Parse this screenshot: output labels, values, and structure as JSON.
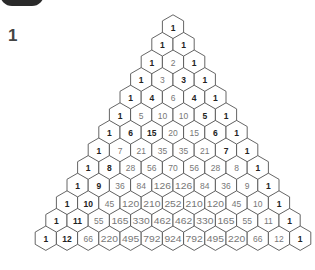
{
  "label": "1",
  "triangle": {
    "rows": [
      [
        1
      ],
      [
        1,
        1
      ],
      [
        1,
        2,
        1
      ],
      [
        1,
        3,
        3,
        1
      ],
      [
        1,
        4,
        6,
        4,
        1
      ],
      [
        1,
        5,
        10,
        10,
        5,
        1
      ],
      [
        1,
        6,
        15,
        20,
        15,
        6,
        1
      ],
      [
        1,
        7,
        21,
        35,
        35,
        21,
        7,
        1
      ],
      [
        1,
        8,
        28,
        56,
        70,
        56,
        28,
        8,
        1
      ],
      [
        1,
        9,
        36,
        84,
        126,
        126,
        84,
        36,
        9,
        1
      ],
      [
        1,
        10,
        45,
        120,
        210,
        252,
        210,
        120,
        45,
        10,
        1
      ],
      [
        1,
        11,
        55,
        165,
        330,
        462,
        462,
        330,
        165,
        55,
        11,
        1
      ],
      [
        1,
        12,
        66,
        220,
        495,
        792,
        924,
        792,
        495,
        220,
        66,
        12,
        1
      ]
    ],
    "bold": [
      [
        0,
        0
      ],
      [
        1,
        0
      ],
      [
        1,
        1
      ],
      [
        2,
        0
      ],
      [
        2,
        2
      ],
      [
        3,
        0
      ],
      [
        3,
        2
      ],
      [
        3,
        3
      ],
      [
        4,
        0
      ],
      [
        4,
        1
      ],
      [
        4,
        3
      ],
      [
        4,
        4
      ],
      [
        5,
        0
      ],
      [
        5,
        4
      ],
      [
        5,
        5
      ],
      [
        6,
        0
      ],
      [
        6,
        1
      ],
      [
        6,
        2
      ],
      [
        6,
        5
      ],
      [
        6,
        6
      ],
      [
        7,
        0
      ],
      [
        7,
        6
      ],
      [
        7,
        7
      ],
      [
        8,
        0
      ],
      [
        8,
        1
      ],
      [
        8,
        8
      ],
      [
        9,
        0
      ],
      [
        9,
        1
      ],
      [
        9,
        9
      ],
      [
        10,
        0
      ],
      [
        10,
        1
      ],
      [
        10,
        10
      ],
      [
        11,
        0
      ],
      [
        11,
        1
      ],
      [
        11,
        11
      ],
      [
        12,
        0
      ],
      [
        12,
        1
      ],
      [
        12,
        12
      ]
    ]
  }
}
